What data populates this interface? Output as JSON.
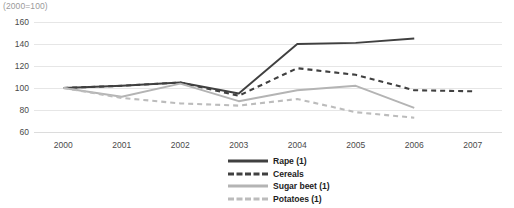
{
  "index_note": "(2000=100)",
  "axes": {
    "y_ticks": [
      "160",
      "140",
      "120",
      "100",
      "80",
      "60"
    ],
    "x_ticks": [
      "2000",
      "2001",
      "2002",
      "2003",
      "2004",
      "2005",
      "2006",
      "2007"
    ]
  },
  "legend": {
    "items": [
      {
        "label": "Rape (1)",
        "key": "rape",
        "style": "solid",
        "color": "#404040"
      },
      {
        "label": "Cereals",
        "key": "cereals",
        "style": "dashed",
        "color": "#404040"
      },
      {
        "label": "Sugar beet (1)",
        "key": "sugar_beet",
        "style": "solid",
        "color": "#b4b4b4"
      },
      {
        "label": "Potatoes (1)",
        "key": "potatoes",
        "style": "dashed",
        "color": "#bcbcbc"
      }
    ]
  },
  "colors": {
    "dark": "#404040",
    "light": "#b4b4b4",
    "light_dashed": "#bcbcbc",
    "grid": "#e6e6e6",
    "tick_text": "#4a4a4a",
    "note_text": "#9a9a9a"
  },
  "chart_data": {
    "type": "line",
    "title": "",
    "subtitle": "",
    "xlabel": "",
    "ylabel": "",
    "annotations": [
      "(2000=100)"
    ],
    "x": [
      2000,
      2001,
      2002,
      2003,
      2004,
      2005,
      2006,
      2007
    ],
    "categories": [
      "2000",
      "2001",
      "2002",
      "2003",
      "2004",
      "2005",
      "2006",
      "2007"
    ],
    "ylim": [
      60,
      160
    ],
    "ytick_values": [
      60,
      80,
      100,
      120,
      140,
      160
    ],
    "grid": true,
    "legend_position": "bottom-center",
    "series": [
      {
        "name": "Rape (1)",
        "style": "solid",
        "color": "#404040",
        "values": [
          100,
          102,
          105,
          95,
          140,
          141,
          145,
          null
        ]
      },
      {
        "name": "Cereals",
        "style": "dashed",
        "color": "#404040",
        "values": [
          100,
          102,
          105,
          93,
          118,
          112,
          98,
          97
        ]
      },
      {
        "name": "Sugar beet (1)",
        "style": "solid",
        "color": "#b4b4b4",
        "values": [
          100,
          92,
          104,
          88,
          98,
          102,
          82,
          null
        ]
      },
      {
        "name": "Potatoes (1)",
        "style": "dashed",
        "color": "#bcbcbc",
        "values": [
          100,
          91,
          86,
          84,
          90,
          78,
          73,
          null
        ]
      }
    ]
  }
}
